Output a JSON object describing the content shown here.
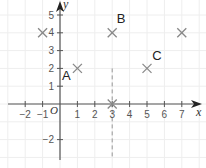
{
  "chart_data": {
    "type": "scatter",
    "title": "",
    "xlabel": "x",
    "ylabel": "y",
    "origin_label": "O",
    "xlim": [
      -3,
      7.5
    ],
    "ylim": [
      -3,
      5.6
    ],
    "grid": true,
    "x_ticks": [
      -2,
      -1,
      1,
      2,
      3,
      4,
      5,
      6,
      7
    ],
    "x_tick_labels": [
      "−2",
      "−1",
      "1",
      "2",
      "3",
      "4",
      "5",
      "6",
      "7"
    ],
    "y_ticks": [
      5,
      4,
      3,
      2,
      1,
      -2
    ],
    "y_tick_labels": [
      "5",
      "4",
      "3",
      "2",
      "1",
      "−2"
    ],
    "points": [
      {
        "label": "",
        "x": -1,
        "y": 4,
        "marker": "cross"
      },
      {
        "label": "A",
        "x": 1,
        "y": 2,
        "marker": "cross"
      },
      {
        "label": "B",
        "x": 3,
        "y": 4,
        "marker": "cross"
      },
      {
        "label": "C",
        "x": 5,
        "y": 2,
        "marker": "cross"
      },
      {
        "label": "",
        "x": 7,
        "y": 4,
        "marker": "cross"
      },
      {
        "label": "",
        "x": 3,
        "y": 0,
        "marker": "cross"
      }
    ],
    "dashed_line": {
      "x": 3,
      "y_from": 2,
      "y_to": -3
    },
    "colors": {
      "axis": "#555555",
      "grid": "#eeeeee",
      "marker": "#888888",
      "dashed": "#999999"
    }
  }
}
